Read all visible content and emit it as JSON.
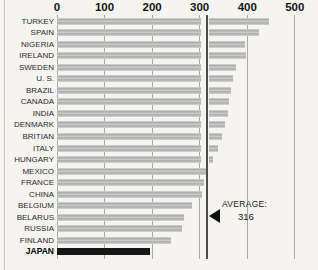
{
  "chart_data": {
    "type": "bar",
    "orientation": "horizontal",
    "title": "",
    "xlabel": "",
    "ylabel": "",
    "x_axis": {
      "ticks": [
        0,
        100,
        200,
        300,
        400,
        500
      ],
      "range": [
        0,
        500
      ],
      "position": "top"
    },
    "grid": true,
    "legend_position": "none",
    "categories": [
      "TURKEY",
      "SPAIN",
      "NIGERIA",
      "IRELAND",
      "SWEDEN",
      "U. S.",
      "BRAZIL",
      "CANADA",
      "INDIA",
      "DENMARK",
      "BRITIAN",
      "ITALY",
      "HUNGARY",
      "MEXICO",
      "FRANCE",
      "CHINA",
      "BELGIUM",
      "BELARUS",
      "RUSSIA",
      "FINLAND",
      "JAPAN"
    ],
    "values": [
      445,
      425,
      396,
      398,
      376,
      370,
      365,
      362,
      360,
      353,
      348,
      338,
      328,
      313,
      309,
      305,
      283,
      266,
      262,
      240,
      195
    ],
    "highlighted_category": "JAPAN",
    "average": {
      "label": "AVERAGE:",
      "value": 316
    },
    "bar_color": "#b9b9b9",
    "highlight_bar_color": "#161616",
    "gridline_color": "#a9a9a9",
    "average_line_color": "#4c4c4c",
    "bar_break_note": "bars crossing the average value are drawn with a white break just left of the average line"
  }
}
